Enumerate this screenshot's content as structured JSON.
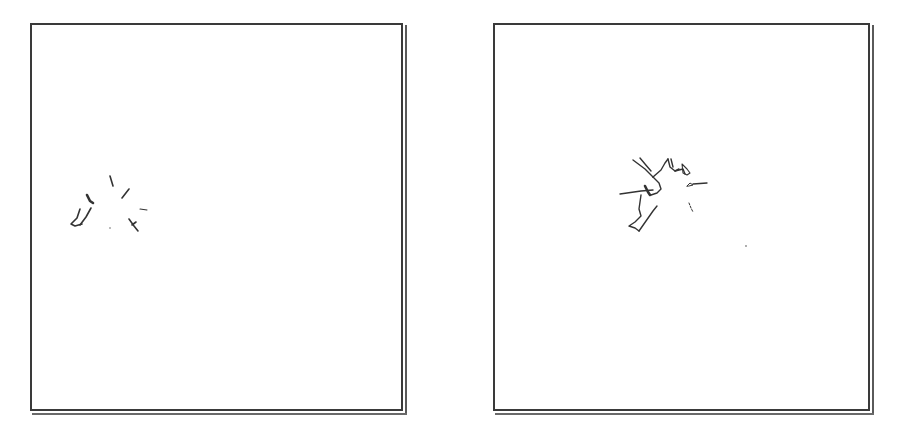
{
  "panels": [
    {
      "id": "left",
      "description": "sparse scattered stroke fragments",
      "stroke_color": "#333333",
      "frame_color": "#3a3a3a"
    },
    {
      "id": "right",
      "description": "connected branching stroke sketch",
      "stroke_color": "#333333",
      "frame_color": "#3a3a3a"
    }
  ]
}
